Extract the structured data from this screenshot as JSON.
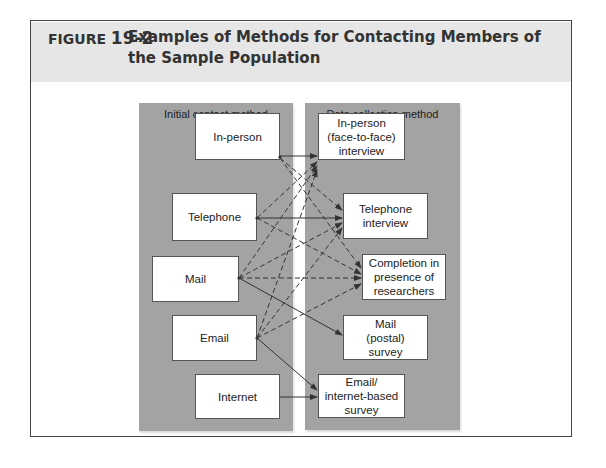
{
  "figure": {
    "label": "FIGURE",
    "number": "19-2",
    "title": "Examples of Methods for Contacting Members of the Sample Population"
  },
  "diagram": {
    "left_panel": {
      "title": "Initial contact method",
      "nodes": [
        "In-person",
        "Telephone",
        "Mail",
        "Email",
        "Internet"
      ]
    },
    "right_panel": {
      "title": "Data collection method",
      "nodes": [
        "In-person (face-to-face) interview",
        "Telephone interview",
        "Completion in presence of researchers",
        "Mail (postal) survey",
        "Email/ internet-based survey"
      ]
    },
    "edges": [
      {
        "from": "In-person",
        "to": "In-person (face-to-face) interview",
        "style": "solid"
      },
      {
        "from": "In-person",
        "to": "Telephone interview",
        "style": "dashed"
      },
      {
        "from": "In-person",
        "to": "Completion in presence of researchers",
        "style": "dashed"
      },
      {
        "from": "Telephone",
        "to": "Telephone interview",
        "style": "solid"
      },
      {
        "from": "Telephone",
        "to": "In-person (face-to-face) interview",
        "style": "dashed"
      },
      {
        "from": "Telephone",
        "to": "Completion in presence of researchers",
        "style": "dashed"
      },
      {
        "from": "Mail",
        "to": "In-person (face-to-face) interview",
        "style": "dashed"
      },
      {
        "from": "Mail",
        "to": "Telephone interview",
        "style": "dashed"
      },
      {
        "from": "Mail",
        "to": "Completion in presence of researchers",
        "style": "dashed"
      },
      {
        "from": "Mail",
        "to": "Mail (postal) survey",
        "style": "solid"
      },
      {
        "from": "Email",
        "to": "In-person (face-to-face) interview",
        "style": "dashed"
      },
      {
        "from": "Email",
        "to": "Telephone interview",
        "style": "dashed"
      },
      {
        "from": "Email",
        "to": "Completion in presence of researchers",
        "style": "dashed"
      },
      {
        "from": "Email",
        "to": "Email/ internet-based survey",
        "style": "solid"
      },
      {
        "from": "Internet",
        "to": "Email/ internet-based survey",
        "style": "solid"
      }
    ]
  },
  "colors": {
    "header_band": "#e6e6e6",
    "panel": "#a3a3a3",
    "box": "#ffffff",
    "line": "#333333"
  }
}
